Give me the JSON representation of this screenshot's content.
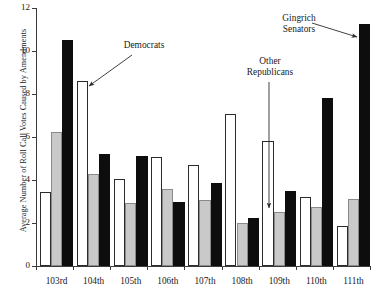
{
  "chart_data": {
    "type": "bar",
    "title": "",
    "xlabel": "",
    "ylabel": "Average Number of Roll Call Votes Caused by Amendments",
    "ylim": [
      0,
      12
    ],
    "yticks": [
      0,
      2,
      4,
      6,
      8,
      10,
      12
    ],
    "grid": false,
    "legend_position": "none",
    "categories": [
      "103rd",
      "104th",
      "105th",
      "106th",
      "107th",
      "108th",
      "109th",
      "110th",
      "111th"
    ],
    "series": [
      {
        "name": "Democrats",
        "color": "#ffffff",
        "values": [
          3.45,
          8.6,
          4.05,
          5.05,
          4.7,
          7.05,
          5.8,
          3.2,
          1.85
        ]
      },
      {
        "name": "Other Republicans",
        "color": "#c9c9c9",
        "values": [
          6.25,
          4.3,
          2.95,
          3.6,
          3.05,
          1.98,
          2.5,
          2.75,
          3.1
        ]
      },
      {
        "name": "Gingrich Senators",
        "color": "#0d0d0d",
        "values": [
          10.5,
          5.2,
          5.1,
          3.0,
          3.85,
          2.25,
          3.5,
          7.8,
          11.25
        ]
      }
    ],
    "annotations": [
      {
        "label": "Democrats",
        "target_group": "104th",
        "target_series": "Democrats"
      },
      {
        "label": "Other\nRepublicans",
        "target_group": "109th",
        "target_series": "Other Republicans"
      },
      {
        "label": "Gingrich\nSenators",
        "target_group": "111th",
        "target_series": "Gingrich Senators"
      }
    ]
  }
}
